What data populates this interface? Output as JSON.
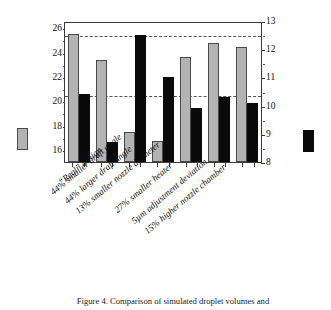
{
  "figure": {
    "caption": "Figure 4. Comparison of simulated droplet volumes and"
  },
  "chart_data": {
    "type": "bar",
    "title": "",
    "xlabel": "",
    "grid": "two horizontal dashed reference lines at the baseline design values",
    "legend_position": "axis-title swatches, left and right",
    "categories": [
      "“Real” design",
      "44% smaller draft angle",
      "44% larger draft angle",
      "13% smaller nozzle diameter",
      "27% smaller heater",
      "5µm adjustment deviation",
      "15% higher nozzle chamber"
    ],
    "series": [
      {
        "name": "Droplet Volume [pl]",
        "axis": "left",
        "color": "#b3b3b3",
        "values": [
          25.5,
          23.4,
          17.5,
          16.7,
          23.6,
          24.8,
          24.5
        ]
      },
      {
        "name": "Droplet Velocity [m/s]",
        "axis": "right",
        "color": "#0a0a0a",
        "values": [
          10.4,
          8.7,
          12.5,
          11.0,
          9.9,
          10.3,
          10.1
        ]
      }
    ],
    "left_axis": {
      "label": "Droplet Volume [pl]",
      "unit": "pl",
      "ylim": [
        15,
        26.6
      ],
      "ticks": [
        16,
        18,
        20,
        22,
        24,
        26
      ]
    },
    "right_axis": {
      "label": "Droplet Velocity [m/s]",
      "unit": "m/s",
      "ylim": [
        8,
        13
      ],
      "ticks": [
        8,
        9,
        10,
        11,
        12,
        13
      ]
    },
    "reference_lines": [
      {
        "name": "baseline-volume",
        "left_axis_value": 25.5
      },
      {
        "name": "baseline-velocity",
        "right_axis_value": 10.4
      }
    ]
  }
}
